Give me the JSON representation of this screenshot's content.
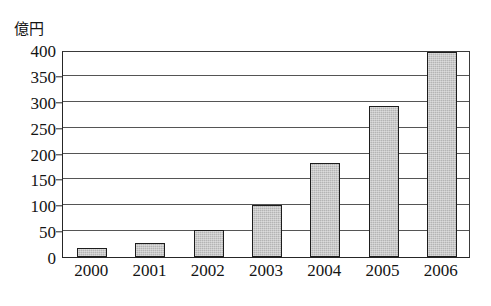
{
  "chart_data": {
    "type": "bar",
    "title": "",
    "subtitle": "",
    "xlabel": "",
    "ylabel": "億円",
    "unit_label": "億円",
    "categories": [
      "2000",
      "2001",
      "2002",
      "2003",
      "2004",
      "2005",
      "2006"
    ],
    "values": [
      17,
      28,
      53,
      100,
      182,
      292,
      397
    ],
    "series": [
      {
        "name": "",
        "values": [
          17,
          28,
          53,
          100,
          182,
          292,
          397
        ]
      }
    ],
    "ylim": [
      0,
      400
    ],
    "ytick_values": [
      0,
      50,
      100,
      150,
      200,
      250,
      300,
      350,
      400
    ],
    "ytick_labels": [
      "0",
      "50",
      "100",
      "150",
      "200",
      "250",
      "300",
      "350",
      "400"
    ],
    "grid": true,
    "grid_axis": "y",
    "legend": false,
    "legend_position": "none",
    "bar_fill_color": "#b4b4b4",
    "bar_edge_color": "#1d1d1d",
    "axis_color": "#262626",
    "grid_color": "#555555",
    "background_color": "#ffffff"
  }
}
